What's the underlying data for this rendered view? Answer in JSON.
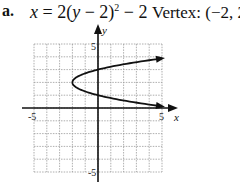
{
  "problem": {
    "label": "a.",
    "equation": {
      "lhs": "x",
      "eq": " = 2(",
      "var": "y",
      "rest": " − 2)",
      "exp": "2",
      "tail": " − 2"
    },
    "vertex_text": "Vertex: (−2, 2)"
  },
  "chart_data": {
    "type": "line",
    "annotation": "Vertex: (−2, 2)",
    "xlabel": "x",
    "ylabel": "y",
    "xlim": [
      -5,
      5
    ],
    "ylim": [
      -5,
      5
    ],
    "grid": true,
    "tick_labels": {
      "x": [
        "-5",
        "5"
      ],
      "y": [
        "5",
        "-5"
      ]
    },
    "series": [
      {
        "name": "x = 2(y-2)^2 - 2",
        "points": [
          [
            5,
            3.87
          ],
          [
            2.5,
            3.5
          ],
          [
            0,
            3
          ],
          [
            -1.5,
            2.5
          ],
          [
            -2,
            2
          ],
          [
            -1.5,
            1.5
          ],
          [
            0,
            1
          ],
          [
            2.5,
            0.5
          ],
          [
            5,
            0.13
          ]
        ],
        "vertex": [
          -2,
          2
        ],
        "arrows_at_ends": true
      }
    ]
  }
}
